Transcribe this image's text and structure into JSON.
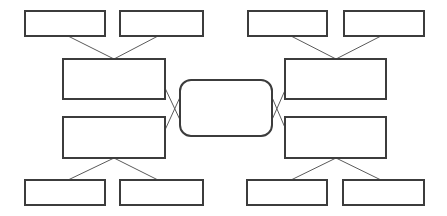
{
  "diagram": {
    "type": "concept-map",
    "title": "",
    "canvas": {
      "width": 447,
      "height": 216,
      "background": "#ffffff"
    },
    "style": {
      "node_fill": "#ffffff",
      "node_stroke": "#3c3c3c",
      "node_stroke_width": 2,
      "connector_stroke": "#5a5a5a",
      "connector_stroke_width": 1
    },
    "nodes": [
      {
        "id": "tl1",
        "label": "",
        "shape": "rect",
        "x": 25,
        "y": 11,
        "w": 80,
        "h": 25
      },
      {
        "id": "tl2",
        "label": "",
        "shape": "rect",
        "x": 120,
        "y": 11,
        "w": 83,
        "h": 25
      },
      {
        "id": "tr1",
        "label": "",
        "shape": "rect",
        "x": 248,
        "y": 11,
        "w": 79,
        "h": 25
      },
      {
        "id": "tr2",
        "label": "",
        "shape": "rect",
        "x": 344,
        "y": 11,
        "w": 80,
        "h": 25
      },
      {
        "id": "ml-upper",
        "label": "",
        "shape": "rect",
        "x": 63,
        "y": 59,
        "w": 102,
        "h": 40
      },
      {
        "id": "ml-lower",
        "label": "",
        "shape": "rect",
        "x": 63,
        "y": 117,
        "w": 102,
        "h": 41
      },
      {
        "id": "mr-upper",
        "label": "",
        "shape": "rect",
        "x": 285,
        "y": 59,
        "w": 101,
        "h": 40
      },
      {
        "id": "mr-lower",
        "label": "",
        "shape": "rect",
        "x": 285,
        "y": 117,
        "w": 101,
        "h": 41
      },
      {
        "id": "center",
        "label": "",
        "shape": "rounded-rect",
        "x": 180,
        "y": 80,
        "w": 92,
        "h": 56,
        "rx": 11
      },
      {
        "id": "bl1",
        "label": "",
        "shape": "rect",
        "x": 25,
        "y": 180,
        "w": 80,
        "h": 25
      },
      {
        "id": "bl2",
        "label": "",
        "shape": "rect",
        "x": 120,
        "y": 180,
        "w": 83,
        "h": 25
      },
      {
        "id": "br1",
        "label": "",
        "shape": "rect",
        "x": 247,
        "y": 180,
        "w": 80,
        "h": 25
      },
      {
        "id": "br2",
        "label": "",
        "shape": "rect",
        "x": 343,
        "y": 180,
        "w": 81,
        "h": 25
      }
    ],
    "edges": [
      {
        "id": "e-tl1",
        "from": "tl1",
        "to": "ml-upper",
        "x1": 68,
        "y1": 36,
        "x2": 114,
        "y2": 59
      },
      {
        "id": "e-tl2",
        "from": "tl2",
        "to": "ml-upper",
        "x1": 158,
        "y1": 36,
        "x2": 114,
        "y2": 59
      },
      {
        "id": "e-tr1",
        "from": "tr1",
        "to": "mr-upper",
        "x1": 291,
        "y1": 36,
        "x2": 336,
        "y2": 59
      },
      {
        "id": "e-tr2",
        "from": "tr2",
        "to": "mr-upper",
        "x1": 381,
        "y1": 36,
        "x2": 336,
        "y2": 59
      },
      {
        "id": "e-mlu-c",
        "from": "ml-upper",
        "to": "center",
        "x1": 165,
        "y1": 88,
        "x2": 181,
        "y2": 122
      },
      {
        "id": "e-mll-c",
        "from": "ml-lower",
        "to": "center",
        "x1": 165,
        "y1": 130,
        "x2": 181,
        "y2": 95
      },
      {
        "id": "e-c-mru",
        "from": "center",
        "to": "mr-upper",
        "x1": 271,
        "y1": 122,
        "x2": 286,
        "y2": 88
      },
      {
        "id": "e-c-mrl",
        "from": "center",
        "to": "mr-lower",
        "x1": 271,
        "y1": 95,
        "x2": 286,
        "y2": 130
      },
      {
        "id": "e-bl1",
        "from": "ml-lower",
        "to": "bl1",
        "x1": 114,
        "y1": 158,
        "x2": 68,
        "y2": 180
      },
      {
        "id": "e-bl2",
        "from": "ml-lower",
        "to": "bl2",
        "x1": 114,
        "y1": 158,
        "x2": 158,
        "y2": 180
      },
      {
        "id": "e-br1",
        "from": "mr-lower",
        "to": "br1",
        "x1": 336,
        "y1": 158,
        "x2": 291,
        "y2": 180
      },
      {
        "id": "e-br2",
        "from": "mr-lower",
        "to": "br2",
        "x1": 336,
        "y1": 158,
        "x2": 381,
        "y2": 180
      }
    ]
  }
}
